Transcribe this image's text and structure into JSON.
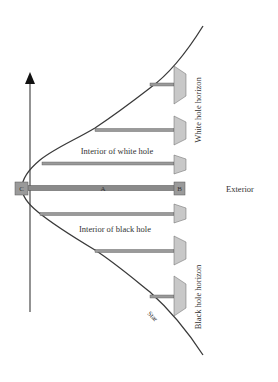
{
  "diagram": {
    "labels": {
      "white_hole_horizon": "White hole horizon",
      "black_hole_horizon": "Black hole horizon",
      "exterior": "Exterior",
      "interior_white_hole": "Interior of white hole",
      "interior_black_hole": "Interior of black hole",
      "star": "Star",
      "point_a": "A",
      "point_b": "B",
      "point_c": "C"
    },
    "colors": {
      "line": "#4a4a4a",
      "bar": "#8a8a8a",
      "box_fill": "#9a9a9a",
      "plate_fill": "#c8c8c8",
      "text": "#333333"
    }
  }
}
